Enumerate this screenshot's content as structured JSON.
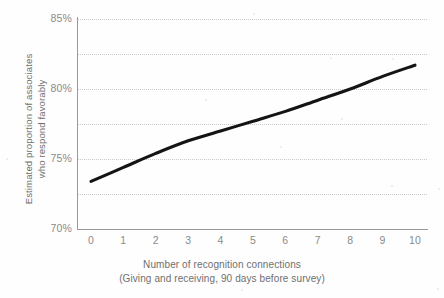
{
  "chart_data": {
    "type": "line",
    "title": "",
    "subtitle": "",
    "xlabel": "Number of recognition connections",
    "xlabel_sub": "(Giving and receiving, 90 days before survey)",
    "ylabel": "Estimated proportion of associates",
    "ylabel_sub": "who respond favorably",
    "x": [
      0,
      1,
      2,
      3,
      4,
      5,
      6,
      7,
      8,
      9,
      10
    ],
    "categories": [
      "0",
      "1",
      "2",
      "3",
      "4",
      "5",
      "6",
      "7",
      "8",
      "9",
      "10"
    ],
    "values": [
      73.4,
      74.4,
      75.4,
      76.3,
      77.0,
      77.7,
      78.4,
      79.2,
      80.0,
      80.9,
      81.7
    ],
    "series": [
      {
        "name": "Estimated proportion responding favorably",
        "values": [
          73.4,
          74.4,
          75.4,
          76.3,
          77.0,
          77.7,
          78.4,
          79.2,
          80.0,
          80.9,
          81.7
        ],
        "color": "#141414"
      }
    ],
    "xlim": [
      0,
      10
    ],
    "ylim": [
      70,
      85
    ],
    "y_tick_values": [
      70,
      75,
      80,
      85
    ],
    "y_tick_labels": [
      "70%",
      "75%",
      "80%",
      "85%"
    ],
    "y_gridline_values": [
      70,
      72.5,
      75,
      77.5,
      80,
      82.5,
      85
    ],
    "x_tick_values": [
      0,
      1,
      2,
      3,
      4,
      5,
      6,
      7,
      8,
      9,
      10
    ],
    "x_tick_labels": [
      "0",
      "1",
      "2",
      "3",
      "4",
      "5",
      "6",
      "7",
      "8",
      "9",
      "10"
    ],
    "grid": "horizontal-dotted",
    "legend": "none",
    "annotations": [],
    "colors": {
      "line": "#141414",
      "gridline": "#c9c9c9",
      "axis": "#9a9a9a",
      "tick_label": "#8a8a8a",
      "axis_title": "#6f6f6f",
      "background": "#fefefe"
    }
  }
}
